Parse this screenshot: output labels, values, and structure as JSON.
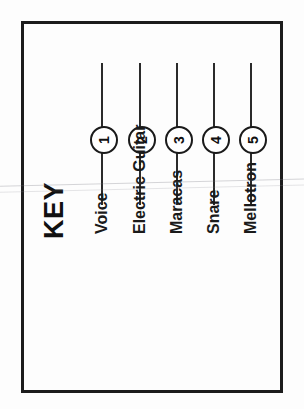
{
  "figure": {
    "title": "KEY",
    "orientation": "rotated-90-ccw",
    "border_color": "#1c1c1c",
    "text_color": "#1a1a1a"
  },
  "chart_data": {
    "type": "table",
    "title": "KEY",
    "xlabel": "",
    "ylabel": "",
    "categories": [
      "Voice",
      "Electric Guitar",
      "Maracas",
      "Snare",
      "Mellotron"
    ],
    "values": [
      1,
      2,
      3,
      4,
      5
    ],
    "series": [
      {
        "name": "legend-markers",
        "values": [
          1,
          2,
          3,
          4,
          5
        ]
      }
    ],
    "annotations": [
      "Numbered circular markers 1-5 on vertical leader lines",
      "Each marker corresponds to an instrument/part label"
    ],
    "legend_position": "left",
    "grid": false
  },
  "legend": {
    "entries": [
      {
        "number": "1",
        "label": "Voice",
        "x": 102
      },
      {
        "number": "2",
        "label": "Electric Guitar",
        "x": 140
      },
      {
        "number": "3",
        "label": "Maracas",
        "x": 177
      },
      {
        "number": "4",
        "label": "Snare",
        "x": 214
      },
      {
        "number": "5",
        "label": "Mellotron",
        "x": 251
      }
    ]
  }
}
